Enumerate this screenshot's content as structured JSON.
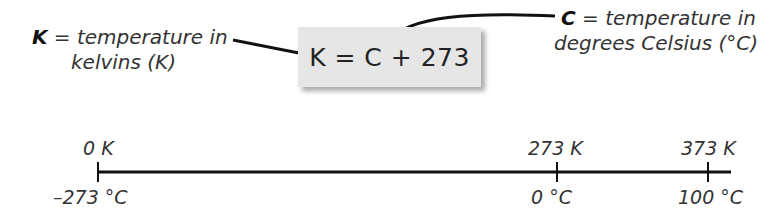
{
  "equation": {
    "text": "K = C + 273",
    "box_color": "#e6e6e6"
  },
  "left_annotation": {
    "variable": "K",
    "line1_rest": " = temperature in",
    "line2": "kelvins (K)"
  },
  "right_annotation": {
    "variable": "C",
    "line1_rest": " = temperature in",
    "line2": "degrees Celsius (°C)"
  },
  "scale": {
    "ticks": [
      {
        "kelvin": "0 K",
        "celsius": "–273 °C"
      },
      {
        "kelvin": "273 K",
        "celsius": "0 °C"
      },
      {
        "kelvin": "373 K",
        "celsius": "100 °C"
      }
    ]
  }
}
